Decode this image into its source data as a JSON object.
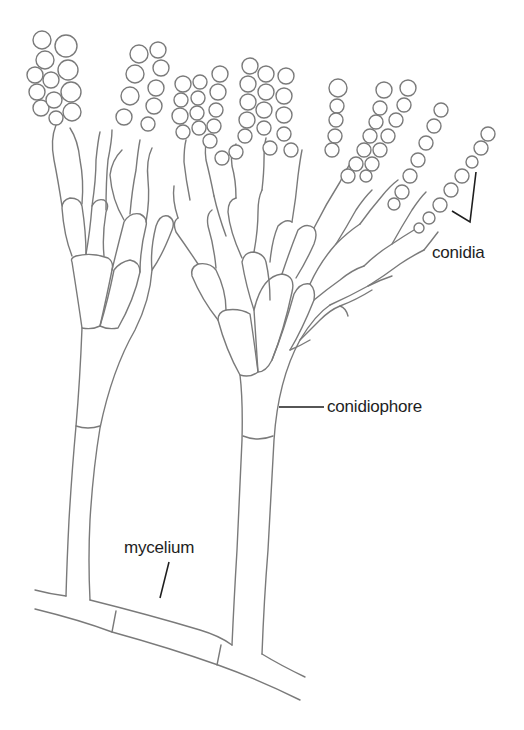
{
  "figure": {
    "labels": {
      "conidia": "conidia",
      "conidiophore": "conidiophore",
      "mycelium": "mycelium"
    },
    "colors": {
      "background": "#ffffff",
      "outline": "#7a7a7a",
      "label_text": "#1e1e1e",
      "leader_line": "#1e1e1e"
    }
  }
}
